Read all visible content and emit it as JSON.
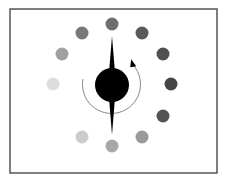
{
  "diagram": {
    "title": "",
    "frame": {
      "x": 10,
      "y": 9,
      "width": 207,
      "height": 164,
      "stroke": "#555555"
    },
    "center": {
      "x": 112,
      "y": 85,
      "radius": 17,
      "color": "#000000"
    },
    "spindle": {
      "top_y": 36,
      "bottom_y": 135,
      "half_width": 4,
      "color": "#000000"
    },
    "rotation_arrow": {
      "radius": 29,
      "color": "#888888",
      "direction": "counterclockwise-from-left-through-bottom-to-upper-right"
    },
    "dots": [
      {
        "cx": 112,
        "cy": 24,
        "r": 6.5,
        "color": "#6e6e6e"
      },
      {
        "cx": 142,
        "cy": 33,
        "r": 6.5,
        "color": "#5a5a5a"
      },
      {
        "cx": 163,
        "cy": 54,
        "r": 6.5,
        "color": "#505050"
      },
      {
        "cx": 171,
        "cy": 84,
        "r": 6.5,
        "color": "#444444"
      },
      {
        "cx": 163,
        "cy": 116,
        "r": 6.5,
        "color": "#545454"
      },
      {
        "cx": 142,
        "cy": 137,
        "r": 6.5,
        "color": "#9a9a9a"
      },
      {
        "cx": 112,
        "cy": 146,
        "r": 6.5,
        "color": "#a8a8a8"
      },
      {
        "cx": 82,
        "cy": 137,
        "r": 6.5,
        "color": "#cccccc"
      },
      {
        "cx": 53,
        "cy": 84,
        "r": 6.5,
        "color": "#dddddd"
      },
      {
        "cx": 62,
        "cy": 54,
        "r": 6.5,
        "color": "#a0a0a0"
      },
      {
        "cx": 82,
        "cy": 33,
        "r": 6.5,
        "color": "#787878"
      }
    ]
  }
}
